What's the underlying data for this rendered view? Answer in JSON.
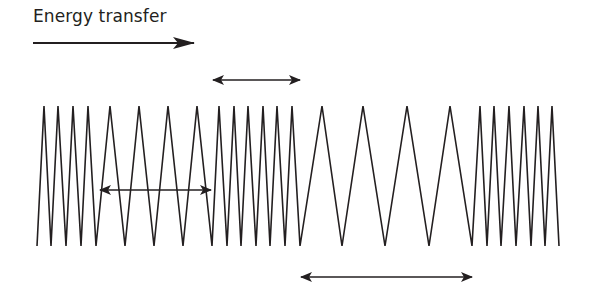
{
  "diagram": {
    "title": "Energy transfer",
    "colors": {
      "stroke": "#231f20",
      "background": "#ffffff"
    },
    "energy_arrow": {
      "x1": 33,
      "x2": 194,
      "y": 43,
      "direction": "right"
    },
    "wave": {
      "peak_y": 106,
      "trough_y": 246,
      "points_x": [
        37,
        44,
        51,
        58,
        66,
        73,
        81,
        88,
        96,
        110,
        125,
        139,
        154,
        168,
        183,
        197,
        212,
        219,
        227,
        234,
        241,
        248,
        256,
        263,
        270,
        277,
        285,
        292,
        300,
        322,
        342,
        363,
        385,
        407,
        429,
        450,
        472,
        480,
        487,
        494,
        501,
        509,
        516,
        524,
        531,
        538,
        545,
        552,
        559
      ],
      "regions": [
        "compression",
        "rarefaction",
        "compression",
        "rarefaction",
        "compression"
      ]
    },
    "double_arrows": [
      {
        "name": "wavelength-arrow-top",
        "x1": 213,
        "x2": 300,
        "y": 80
      },
      {
        "name": "wavelength-arrow-middle",
        "x1": 100,
        "x2": 211,
        "y": 190
      },
      {
        "name": "wavelength-arrow-bottom",
        "x1": 301,
        "x2": 472,
        "y": 277
      }
    ]
  }
}
